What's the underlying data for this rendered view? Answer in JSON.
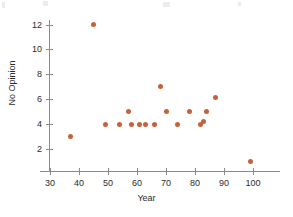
{
  "chart_data": {
    "type": "scatter",
    "title": "",
    "xlabel": "Year",
    "ylabel": "No Opinion",
    "xlim": [
      27,
      110
    ],
    "ylim": [
      0,
      13
    ],
    "grid": false,
    "legend": null,
    "marker_color": "#c2633c",
    "axis_color": "#8a8a8a",
    "text_color": "#2b2b2b",
    "xticks": [
      30,
      40,
      50,
      60,
      70,
      80,
      90,
      100
    ],
    "xtick_labels": [
      "30",
      "40",
      "50",
      "60",
      "70",
      "80",
      "90",
      "100"
    ],
    "yticks": [
      2,
      4,
      6,
      8,
      10,
      12
    ],
    "ytick_labels": [
      "2",
      "4",
      "6",
      "8",
      "10",
      "12"
    ],
    "points": [
      {
        "x": 37,
        "y": 3
      },
      {
        "x": 45,
        "y": 12
      },
      {
        "x": 49,
        "y": 4
      },
      {
        "x": 54,
        "y": 4
      },
      {
        "x": 57,
        "y": 5
      },
      {
        "x": 58,
        "y": 4
      },
      {
        "x": 61,
        "y": 4
      },
      {
        "x": 63,
        "y": 4
      },
      {
        "x": 66,
        "y": 4
      },
      {
        "x": 68,
        "y": 7
      },
      {
        "x": 70,
        "y": 5
      },
      {
        "x": 74,
        "y": 4
      },
      {
        "x": 78,
        "y": 5
      },
      {
        "x": 82,
        "y": 4
      },
      {
        "x": 83,
        "y": 4.2
      },
      {
        "x": 84,
        "y": 5
      },
      {
        "x": 87,
        "y": 6.1
      },
      {
        "x": 99,
        "y": 1
      }
    ]
  }
}
